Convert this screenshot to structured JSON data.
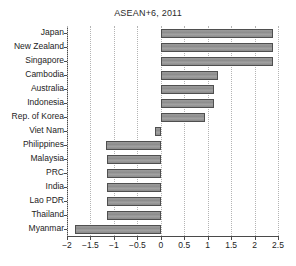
{
  "chart_data": {
    "type": "bar",
    "orientation": "horizontal",
    "title": "ASEAN+6, 2011",
    "xlabel": "",
    "ylabel": "",
    "categories": [
      "Japan",
      "New Zealand",
      "Singapore",
      "Cambodia",
      "Australia",
      "Indonesia",
      "Rep. of Korea",
      "Viet Nam",
      "Philippines",
      "Malaysia",
      "PRC",
      "India",
      "Lao PDR",
      "Thailand",
      "Myanmar"
    ],
    "values": [
      2.4,
      2.4,
      2.4,
      1.21,
      1.13,
      1.13,
      0.94,
      -0.13,
      -1.16,
      -1.15,
      -1.15,
      -1.15,
      -1.15,
      -1.15,
      -1.83
    ],
    "xlim": [
      -2,
      2.5
    ],
    "xticks": [
      -2,
      -1.5,
      -1,
      -0.5,
      0,
      0.5,
      1,
      1.5,
      2,
      2.5
    ],
    "xtick_labels": [
      "-2",
      "-1.5",
      "-1",
      "-0.5",
      "0",
      "0.5",
      "1",
      "1.5",
      "2",
      "2.5"
    ],
    "grid": true,
    "grid_axis": "x",
    "grid_style": "dotted",
    "legend": null,
    "bar_fill_color": "#8d8d8d",
    "bar_edge_color": "#4f4f4f",
    "axis_color": "#4a4a4a",
    "grid_color": "#b4b4b4",
    "background_color": "#ffffff"
  }
}
